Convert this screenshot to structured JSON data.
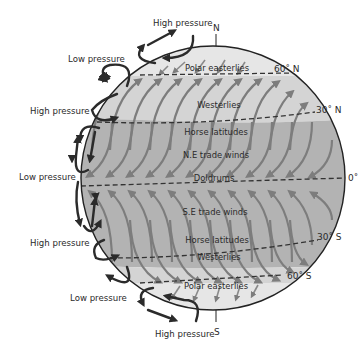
{
  "colors": {
    "background": "#ffffff",
    "polar_band": "#e6e6e6",
    "westerlies_band": "#d4d4d4",
    "tropical_band": "#b3b3b3",
    "wind_arrow": "#7d7d7d",
    "outline": "#222222",
    "cell_arrow": "#2b2b2b"
  },
  "poles": {
    "north": "N",
    "south": "S"
  },
  "latitudes": [
    {
      "label": "60˚ N"
    },
    {
      "label": "30˚ N"
    },
    {
      "label": "0˚"
    },
    {
      "label": "30˚ S"
    },
    {
      "label": "60˚ S"
    }
  ],
  "wind_zones": [
    {
      "label": "Polar easterlies"
    },
    {
      "label": "Westerlies"
    },
    {
      "label": "Horse latitudes"
    },
    {
      "label": "N.E trade winds"
    },
    {
      "label": "Doldrums"
    },
    {
      "label": "S.E trade winds"
    },
    {
      "label": "Horse latitudes"
    },
    {
      "label": "Westerlies"
    },
    {
      "label": "Polar easterlies"
    }
  ],
  "pressure_labels": [
    {
      "label": "High pressure"
    },
    {
      "label": "Low pressure"
    },
    {
      "label": "High pressure"
    },
    {
      "label": "Low pressure"
    },
    {
      "label": "High pressure"
    },
    {
      "label": "Low pressure"
    },
    {
      "label": "High pressure"
    }
  ],
  "icons": {
    "circulation_cell": "curved-arrow-loop",
    "wind": "curved-arrow"
  }
}
